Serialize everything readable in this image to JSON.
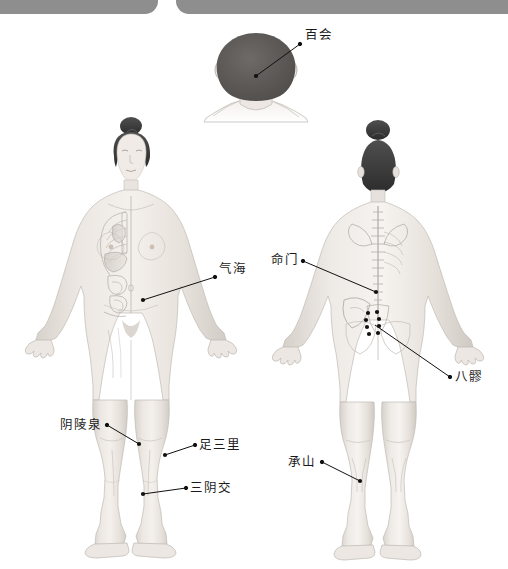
{
  "page": {
    "background_color": "#ffffff",
    "header_band_color": "#8e8e8e",
    "label_color": "#1a1a1a",
    "leader_line_color": "#111111",
    "point_marker_color": "#111111",
    "hair_color": "#4a4a4a",
    "skin_color": "#e9e4df"
  },
  "figures": {
    "head": {
      "name": "back-of-head-view",
      "caption": ""
    },
    "front": {
      "name": "front-body-view",
      "caption": ""
    },
    "back": {
      "name": "back-body-view",
      "caption": ""
    }
  },
  "acupoints": [
    {
      "id": "baihui",
      "label": "百会",
      "figure": "head",
      "label_x": 305,
      "label_y": 29,
      "point_x": 256,
      "point_y": 76,
      "dot_x": 300,
      "dot_y": 44
    },
    {
      "id": "qihai",
      "label": "气海",
      "figure": "front",
      "label_x": 219,
      "label_y": 263,
      "point_x": 143,
      "point_y": 300,
      "dot_x": 215,
      "dot_y": 277
    },
    {
      "id": "yinlingquan",
      "label": "阴陵泉",
      "figure": "front",
      "label_x": 60,
      "label_y": 419,
      "point_x": 139,
      "point_y": 444,
      "dot_x": 107,
      "dot_y": 425
    },
    {
      "id": "zusanli",
      "label": "足三里",
      "figure": "front",
      "label_x": 199,
      "label_y": 439,
      "point_x": 165,
      "point_y": 455,
      "dot_x": 195,
      "dot_y": 445
    },
    {
      "id": "sanyinjiao",
      "label": "三阴交",
      "figure": "front",
      "label_x": 190,
      "label_y": 482,
      "point_x": 143,
      "point_y": 494,
      "dot_x": 186,
      "dot_y": 488
    },
    {
      "id": "mingmen",
      "label": "命门",
      "figure": "back",
      "label_x": 271,
      "label_y": 254,
      "point_x": 376,
      "point_y": 292,
      "dot_x": 303,
      "dot_y": 261
    },
    {
      "id": "baliao",
      "label": "八髎",
      "figure": "back",
      "label_x": 455,
      "label_y": 371,
      "point_x": 375,
      "point_y": 325,
      "dot_x": 450,
      "dot_y": 377
    },
    {
      "id": "chengshan",
      "label": "承山",
      "figure": "back",
      "label_x": 288,
      "label_y": 456,
      "point_x": 360,
      "point_y": 481,
      "dot_x": 322,
      "dot_y": 462
    }
  ],
  "baliao_cluster": {
    "name": "baliao-eight-points",
    "dots": [
      {
        "x": 368,
        "y": 313
      },
      {
        "x": 377,
        "y": 312
      },
      {
        "x": 366,
        "y": 320
      },
      {
        "x": 379,
        "y": 319
      },
      {
        "x": 367,
        "y": 327
      },
      {
        "x": 379,
        "y": 326
      },
      {
        "x": 369,
        "y": 334
      },
      {
        "x": 378,
        "y": 333
      }
    ]
  }
}
